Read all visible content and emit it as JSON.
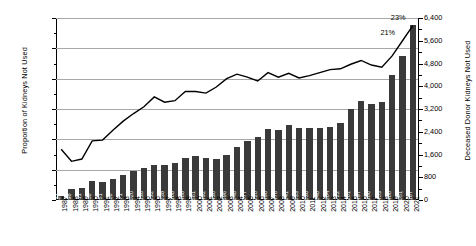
{
  "chart_data": {
    "type": "bar",
    "title": "",
    "xlabel": "",
    "ylabel": "Proportion of Kidneys Not Used",
    "y2label": "Deceased Donor Kidneys Not Used",
    "ylim": [
      0,
      24
    ],
    "y2lim": [
      0,
      6400
    ],
    "ytick_labels": [
      "0%",
      "4%",
      "8%",
      "12%",
      "16%",
      "20%",
      "24%"
    ],
    "ytick_values": [
      0,
      4,
      8,
      12,
      16,
      20,
      24
    ],
    "y2tick_labels": [
      "0",
      "800",
      "1,600",
      "2,400",
      "3,200",
      "4,000",
      "4,800",
      "5,600",
      "6,400"
    ],
    "y2tick_values": [
      0,
      800,
      1600,
      2400,
      3200,
      4000,
      4800,
      5600,
      6400
    ],
    "grid": true,
    "legend": "none",
    "categories": [
      "1987",
      "1988",
      "1989",
      "1990",
      "1991",
      "1992",
      "1993",
      "1994",
      "1995",
      "1996",
      "1997",
      "1998",
      "1999",
      "2000",
      "2001",
      "2002",
      "2003",
      "2004",
      "2005",
      "2006",
      "2007",
      "2008",
      "2009",
      "2010",
      "2011",
      "2012",
      "2013",
      "2014",
      "2015",
      "2016",
      "2017",
      "2018",
      "2019",
      "2020",
      "2021"
    ],
    "series": [
      {
        "name": "Deceased Donor Kidneys Not Used",
        "type": "bar",
        "axis": "right",
        "color": "#3a3a3a",
        "values": [
          124,
          398,
          411,
          658,
          651,
          726,
          871,
          1020,
          1136,
          1232,
          1238,
          1308,
          1468,
          1561,
          1492,
          1430,
          1596,
          1848,
          2077,
          2220,
          2498,
          2476,
          2641,
          2533,
          2538,
          2548,
          2564,
          2722,
          3201,
          3497,
          3386,
          3453,
          4400,
          5051,
          6167
        ],
        "value_labels": [
          "124",
          "398",
          "411",
          "658",
          "651",
          "726",
          "871",
          "1,020",
          "1,136",
          "1,232",
          "1,238",
          "1,308",
          "1,468",
          "1,561",
          "1,492",
          "1,430",
          "1,596",
          "1,848",
          "2,077",
          "2,220",
          "2,498",
          "2,476",
          "2,641",
          "2,533",
          "2,538",
          "2,548",
          "2,564",
          "2,722",
          "3,201",
          "3,497",
          "3,386",
          "3,453",
          "4,400",
          "5,051",
          "6,167"
        ]
      },
      {
        "name": "Proportion of Kidneys Not Used",
        "type": "line",
        "axis": "left",
        "color": "#000000",
        "values": [
          6.7,
          5.1,
          5.4,
          7.8,
          7.9,
          9.2,
          10.4,
          11.4,
          12.3,
          13.6,
          12.9,
          13.1,
          14.3,
          14.3,
          14.1,
          14.9,
          16.0,
          16.6,
          16.2,
          15.7,
          16.8,
          16.2,
          16.7,
          16.1,
          16.4,
          16.8,
          17.2,
          17.3,
          17.9,
          18.4,
          17.8,
          17.5,
          19.0,
          21.0,
          23.0
        ]
      }
    ],
    "annotations": [
      {
        "text": "21%",
        "x_category": "2020",
        "value": 21
      },
      {
        "text": "23%",
        "x_category": "2021",
        "value": 23
      }
    ]
  }
}
